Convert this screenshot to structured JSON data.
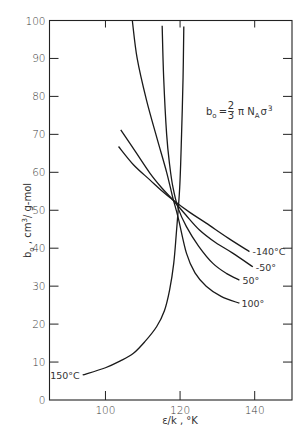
{
  "chart_data": {
    "type": "line",
    "title": "",
    "xlabel": "ε/k, °K",
    "ylabel": "b₀, cm³/g-mol",
    "xlim": [
      85,
      150
    ],
    "ylim": [
      0,
      100
    ],
    "grid": false,
    "x_ticks": [
      100,
      120,
      140
    ],
    "y_ticks": [
      0,
      10,
      20,
      30,
      40,
      50,
      60,
      70,
      80,
      90,
      100
    ],
    "annotation": "b₀ = (2/3) π N_A σ³",
    "series": [
      {
        "name": "-140°C",
        "label": "-140°C",
        "points": [
          [
            103.5,
            66.8
          ],
          [
            107.5,
            62.0
          ],
          [
            111.9,
            58.0
          ],
          [
            115.0,
            55.2
          ],
          [
            118.1,
            52.7
          ],
          [
            122.5,
            49.5
          ],
          [
            127.0,
            46.6
          ],
          [
            133.0,
            42.6
          ],
          [
            138.6,
            39.1
          ]
        ]
      },
      {
        "name": "-50°C",
        "label": "-50°",
        "points": [
          [
            104.1,
            71.2
          ],
          [
            108.0,
            65.5
          ],
          [
            111.9,
            59.8
          ],
          [
            115.0,
            56.0
          ],
          [
            118.1,
            52.7
          ],
          [
            121.5,
            48.8
          ],
          [
            125.2,
            44.8
          ],
          [
            129.5,
            41.5
          ],
          [
            134.1,
            38.7
          ],
          [
            139.5,
            35.1
          ]
        ]
      },
      {
        "name": "50°C",
        "label": "50°",
        "points": [
          [
            115.2,
            98.6
          ],
          [
            115.6,
            85.0
          ],
          [
            116.4,
            70.0
          ],
          [
            117.2,
            62.0
          ],
          [
            118.1,
            56.0
          ],
          [
            119.5,
            50.5
          ],
          [
            121.7,
            45.7
          ],
          [
            125.0,
            40.5
          ],
          [
            128.8,
            36.0
          ],
          [
            132.5,
            33.3
          ],
          [
            135.9,
            31.6
          ]
        ]
      },
      {
        "name": "100°C",
        "label": "100°",
        "points": [
          [
            107.2,
            100.0
          ],
          [
            108.5,
            90.0
          ],
          [
            111.0,
            79.0
          ],
          [
            113.8,
            69.0
          ],
          [
            116.4,
            60.0
          ],
          [
            118.0,
            53.5
          ],
          [
            119.5,
            48.0
          ],
          [
            121.7,
            38.7
          ],
          [
            124.0,
            33.5
          ],
          [
            127.0,
            30.0
          ],
          [
            131.0,
            27.3
          ],
          [
            135.9,
            25.5
          ]
        ]
      },
      {
        "name": "150°C",
        "label": "150°C",
        "points": [
          [
            93.9,
            6.6
          ],
          [
            100.0,
            8.5
          ],
          [
            104.0,
            10.3
          ],
          [
            107.5,
            12.3
          ],
          [
            110.5,
            15.3
          ],
          [
            113.7,
            19.3
          ],
          [
            115.8,
            23.5
          ],
          [
            117.2,
            29.0
          ],
          [
            118.3,
            36.0
          ],
          [
            119.0,
            44.0
          ],
          [
            119.9,
            56.0
          ],
          [
            120.4,
            70.0
          ],
          [
            120.8,
            85.0
          ],
          [
            121.0,
            98.4
          ]
        ]
      }
    ]
  },
  "labels": {
    "y_axis_title_main": "b",
    "y_axis_title_sub": "o",
    "y_axis_title_rest": " , cm",
    "y_axis_title_sup": "3",
    "y_axis_title_end": "/ g-mol",
    "x_axis_title": "ε/k , °K",
    "formula_lhs_main": "b",
    "formula_lhs_sub": "o",
    "formula_eq": "=",
    "formula_frac_num": "2",
    "formula_frac_den": "3",
    "formula_pi": "π N",
    "formula_na_sub": "A",
    "formula_sigma": "σ",
    "formula_sup": "3"
  }
}
